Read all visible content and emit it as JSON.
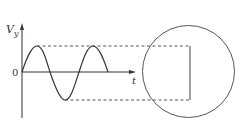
{
  "diagram": {
    "y_axis_label": "V",
    "y_axis_subscript": "y",
    "x_axis_label": "t",
    "origin_label": "0",
    "colors": {
      "stroke": "#333333",
      "circle": "#555555",
      "dashed": "#444444",
      "background": "#ffffff"
    },
    "waveform": {
      "type": "sine",
      "cycles": 1.5,
      "description": "sinusoidal deflection voltage Vy vs time"
    },
    "screen": {
      "shape": "circle",
      "trace": "vertical line spanning peak-to-peak amplitude"
    }
  }
}
